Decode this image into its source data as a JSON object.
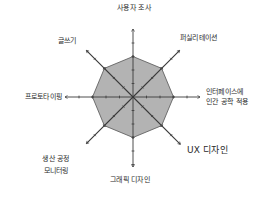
{
  "chart_data": {
    "type": "radar",
    "title": "",
    "axes": [
      "사용자 조사",
      "퍼실리테이션",
      "인터페이스에 인간 공학 적용",
      "UX 디자인",
      "그래픽 디자인",
      "생산 공정 모니터링",
      "프로토타이핑",
      "글쓰기"
    ],
    "series": [
      {
        "name": "skills",
        "values": [
          3,
          3,
          3,
          3,
          3,
          3,
          3,
          3
        ]
      }
    ],
    "scale": {
      "min": 0,
      "max": 5,
      "ticks": 5
    },
    "grid": false,
    "legend": "none",
    "colors": {
      "fill": "#b3b3b3",
      "stroke": "#555555",
      "axis": "#3a3a3a"
    }
  },
  "labels": {
    "top": "사용자 조사",
    "top_right": "퍼실리테이션",
    "right_line1": "인터페이스에",
    "right_line2": "인간 공학 적용",
    "bottom_right": "UX 디자인",
    "bottom": "그래픽 디자인",
    "bottom_left_line1": "생산 공정",
    "bottom_left_line2": "모니터링",
    "left": "프로토타이핑",
    "top_left": "글쓰기"
  }
}
